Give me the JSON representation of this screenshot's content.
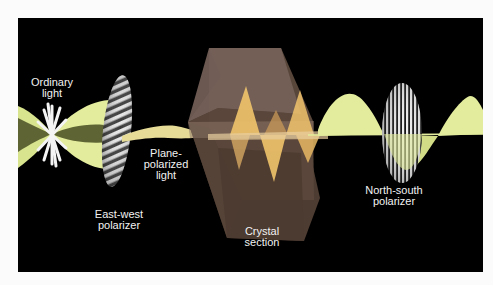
{
  "diagram": {
    "colors": {
      "page_background": "#fbfbfb",
      "panel_background": "#000000",
      "light_wave": "#e2ec9c",
      "light_wave_shadow": "#5e6433",
      "crystal_face": "#6f5a4c",
      "crystal_wave": "#f1c46c",
      "polarizer_stripe": "#e8e8e8",
      "label_text": "#f2f2f2"
    },
    "labels": {
      "ordinary_light": {
        "line1": "Ordinary",
        "line2": "light"
      },
      "east_west_polarizer": {
        "line1": "East-west",
        "line2": "polarizer"
      },
      "plane_polarized_light": {
        "line1": "Plane-",
        "line2": "polarized",
        "line3": "light"
      },
      "crystal_section": {
        "line1": "Crystal",
        "line2": "section"
      },
      "north_south_polarizer": {
        "line1": "North-south",
        "line2": "polarizer"
      }
    },
    "components": [
      {
        "name": "Ordinary light",
        "icon": "starburst-icon"
      },
      {
        "name": "East-west polarizer",
        "icon": "diagonal-striped-ellipse"
      },
      {
        "name": "Plane-polarized light",
        "icon": "thin-wave"
      },
      {
        "name": "Crystal section",
        "icon": "hexagonal-prism"
      },
      {
        "name": "North-south polarizer",
        "icon": "vertical-striped-ellipse"
      }
    ]
  }
}
